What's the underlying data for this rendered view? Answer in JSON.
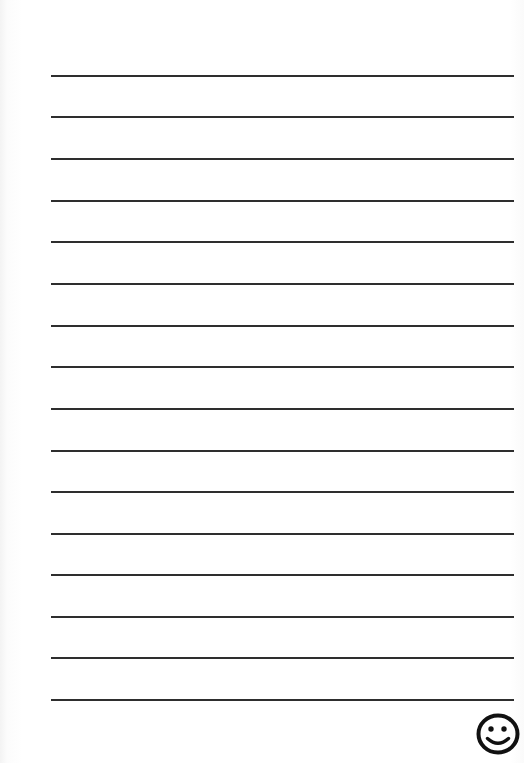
{
  "page": {
    "kind": "lined-notepaper-scan",
    "width": 524,
    "height": 763,
    "background_color": "#ffffff",
    "visible_text": ""
  },
  "ruled_lines": {
    "count": 16,
    "color": "#2e2e2e",
    "thickness_px": 2,
    "x_start": 51,
    "x_end": 514,
    "first_line_y": 75,
    "spacing_px": 41.6,
    "y_positions": [
      75,
      116,
      158,
      200,
      241,
      283,
      325,
      366,
      408,
      450,
      491,
      533,
      574,
      616,
      657,
      699
    ]
  },
  "doodle": {
    "icon_name": "smiley-face-icon",
    "description": "hand-inked smiling face emoticon",
    "color": "#111111",
    "stroke_width": 4,
    "x": 476,
    "y": 711,
    "width": 46,
    "height": 46,
    "clipped_at_right_edge": true,
    "features": {
      "outline_shape": "ellipse",
      "eye_count": 2,
      "eye_shape": "filled-dot",
      "mouth_shape": "upturned-arc"
    }
  }
}
